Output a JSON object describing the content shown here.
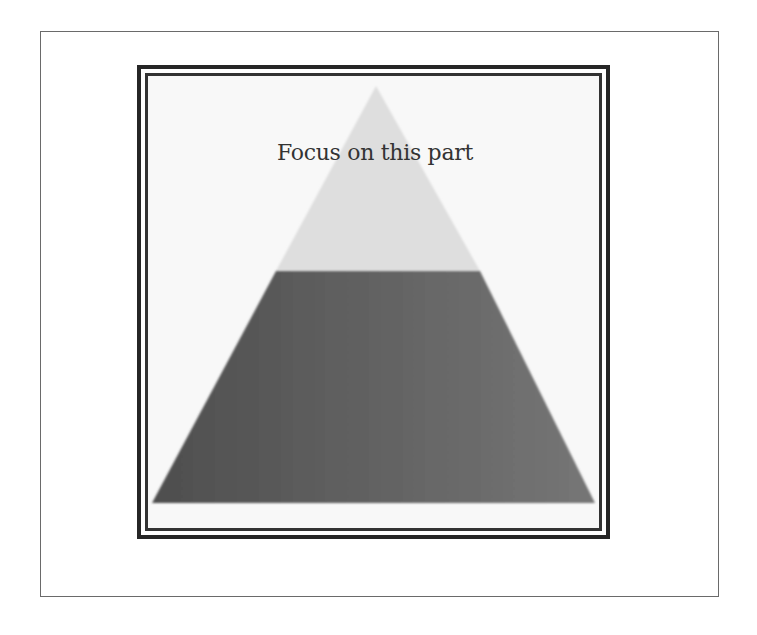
{
  "diagram": {
    "type": "pyramid",
    "caption": "Focus on this part",
    "levels": [
      {
        "name": "top",
        "color": "#dcdcdc",
        "highlighted": true
      },
      {
        "name": "bottom",
        "color": "#6a6a6a",
        "highlighted": false
      }
    ],
    "colors": {
      "frame_border": "#262626",
      "outer_border": "#6a6a6a",
      "background": "#ffffff"
    }
  }
}
